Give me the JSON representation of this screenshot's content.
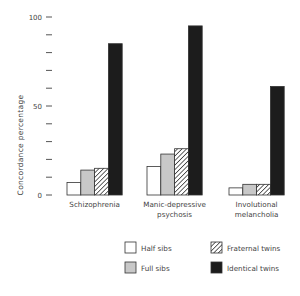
{
  "chart_data": {
    "type": "bar",
    "title": "",
    "xlabel": "",
    "ylabel": "Concordance percentage",
    "ylim": [
      0,
      100
    ],
    "yticks": [
      0,
      10,
      20,
      30,
      40,
      50,
      60,
      70,
      80,
      90,
      100
    ],
    "ytick_labels": {
      "0": "0",
      "50": "50",
      "100": "100"
    },
    "grid": false,
    "legend_position": "bottom-right",
    "categories": [
      "Schizophrenia",
      "Manic-depressive psychosis",
      "Involutional melancholia"
    ],
    "category_label_lines": [
      [
        "Schizophrenia"
      ],
      [
        "Manic-depressive",
        "psychosis"
      ],
      [
        "Involutional",
        "melancholia"
      ]
    ],
    "series": [
      {
        "name": "Half sibs",
        "pattern": "white",
        "values": [
          7,
          16,
          4
        ]
      },
      {
        "name": "Full sibs",
        "pattern": "gray",
        "values": [
          14,
          23,
          6
        ]
      },
      {
        "name": "Fraternal twins",
        "pattern": "hatched",
        "values": [
          15,
          26,
          6
        ]
      },
      {
        "name": "Identical twins",
        "pattern": "black",
        "values": [
          85,
          95,
          61
        ]
      }
    ],
    "colors": {
      "white": "#ffffff",
      "gray": "#c8c8c8",
      "hatched": "#ffffff",
      "black": "#1c1c1c",
      "outline": "#333333"
    }
  }
}
